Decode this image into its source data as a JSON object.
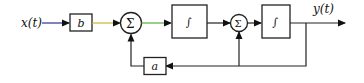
{
  "diagram": {
    "input_label": "x(t)",
    "output_label": "y(t)",
    "gain_b_label": "b",
    "gain_a_label": "a",
    "sum1_symbol": "Σ",
    "sum2_symbol": "Σ",
    "integrator1_symbol": "∫",
    "integrator2_symbol": "∫",
    "colors": {
      "input_wire": "#2b2f9e",
      "b_to_sum_wire": "#c9b23a",
      "sum_to_integrator_wire": "#5aa83a",
      "default_wire": "#222222"
    }
  }
}
